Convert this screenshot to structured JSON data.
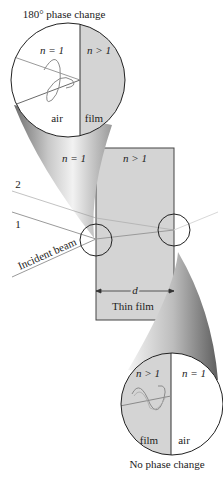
{
  "title_top": "180° phase change",
  "title_bottom": "No phase change",
  "top_inset": {
    "left_index": "n = 1",
    "right_index": "n > 1",
    "left_medium": "air",
    "right_medium": "film"
  },
  "main": {
    "left_index": "n = 1",
    "film_index": "n > 1",
    "ray_1": "1",
    "ray_2": "2",
    "incident": "Incident beam",
    "thickness": "d",
    "film_label": "Thin film"
  },
  "bottom_inset": {
    "left_index": "n > 1",
    "right_index": "n = 1",
    "left_medium": "film",
    "right_medium": "air"
  },
  "colors": {
    "film": "#d4d4d4",
    "ray": "#9a9a9a",
    "outline": "#333333"
  }
}
